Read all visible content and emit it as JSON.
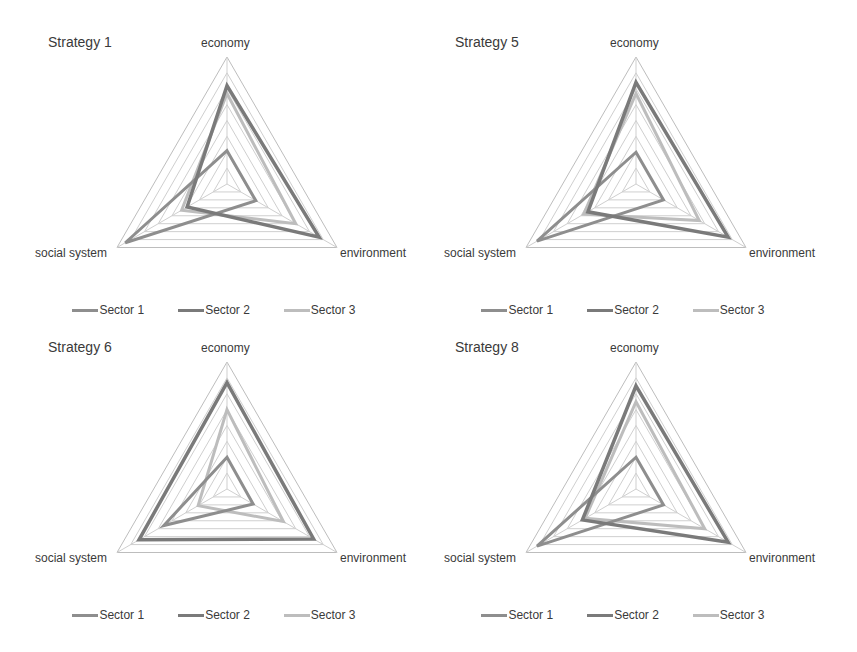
{
  "axes": [
    "economy",
    "environment",
    "social system"
  ],
  "scale_max": 8,
  "grid_levels": 8,
  "legend": [
    {
      "name": "Sector 1",
      "color": "#8e8e8e"
    },
    {
      "name": "Sector 2",
      "color": "#7a7a7a"
    },
    {
      "name": "Sector 3",
      "color": "#bdbdbd"
    }
  ],
  "panels": [
    {
      "title": "Strategy 1"
    },
    {
      "title": "Strategy 5"
    },
    {
      "title": "Strategy 6"
    },
    {
      "title": "Strategy 8"
    }
  ],
  "chart_data": [
    {
      "type": "radar",
      "title": "Strategy 1",
      "categories": [
        "economy",
        "environment",
        "social system"
      ],
      "rlim": [
        0,
        8
      ],
      "grid": true,
      "legend_position": "bottom",
      "series": [
        {
          "name": "Sector 1",
          "values": [
            2.1,
            2.1,
            7.4
          ]
        },
        {
          "name": "Sector 2",
          "values": [
            6.2,
            6.7,
            2.9
          ]
        },
        {
          "name": "Sector 3",
          "values": [
            5.7,
            5.0,
            3.3
          ]
        }
      ]
    },
    {
      "type": "radar",
      "title": "Strategy 5",
      "categories": [
        "economy",
        "environment",
        "social system"
      ],
      "rlim": [
        0,
        8
      ],
      "grid": true,
      "legend_position": "bottom",
      "series": [
        {
          "name": "Sector 1",
          "values": [
            2.0,
            2.0,
            7.2
          ]
        },
        {
          "name": "Sector 2",
          "values": [
            6.4,
            6.7,
            3.5
          ]
        },
        {
          "name": "Sector 3",
          "values": [
            5.7,
            4.6,
            3.8
          ]
        }
      ]
    },
    {
      "type": "radar",
      "title": "Strategy 6",
      "categories": [
        "economy",
        "environment",
        "social system"
      ],
      "rlim": [
        0,
        8
      ],
      "grid": true,
      "legend_position": "bottom",
      "series": [
        {
          "name": "Sector 1",
          "values": [
            2.0,
            1.9,
            4.6
          ]
        },
        {
          "name": "Sector 2",
          "values": [
            6.7,
            6.3,
            6.4
          ]
        },
        {
          "name": "Sector 3",
          "values": [
            5.0,
            4.1,
            2.1
          ]
        }
      ]
    },
    {
      "type": "radar",
      "title": "Strategy 8",
      "categories": [
        "economy",
        "environment",
        "social system"
      ],
      "rlim": [
        0,
        8
      ],
      "grid": true,
      "legend_position": "bottom",
      "series": [
        {
          "name": "Sector 1",
          "values": [
            2.0,
            2.0,
            7.2
          ]
        },
        {
          "name": "Sector 2",
          "values": [
            6.5,
            6.7,
            3.9
          ]
        },
        {
          "name": "Sector 3",
          "values": [
            5.5,
            5.0,
            3.7
          ]
        }
      ]
    }
  ]
}
